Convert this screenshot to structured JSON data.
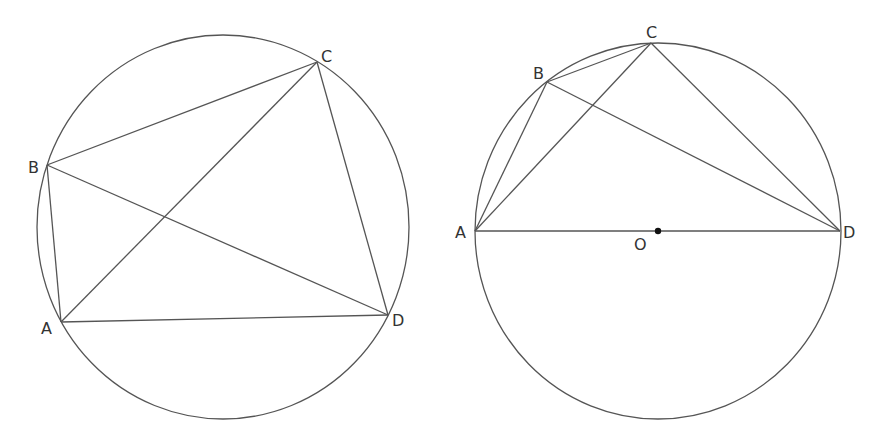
{
  "colors": {
    "stroke": "#555555",
    "label": "#333333",
    "background": "#ffffff",
    "center_dot": "#111111"
  },
  "figures": [
    {
      "id": "left",
      "circle": {
        "cx": 223,
        "cy": 227,
        "rx": 186,
        "ry": 192
      },
      "points": {
        "A": {
          "label": "A",
          "x": 61,
          "y": 322,
          "lx": 41,
          "ly": 334
        },
        "B": {
          "label": "B",
          "x": 47,
          "y": 165,
          "lx": 28,
          "ly": 173
        },
        "C": {
          "label": "C",
          "x": 317,
          "y": 62,
          "lx": 321,
          "ly": 62
        },
        "D": {
          "label": "D",
          "x": 388,
          "y": 315,
          "lx": 392,
          "ly": 326
        }
      },
      "segments": [
        [
          "A",
          "B"
        ],
        [
          "B",
          "C"
        ],
        [
          "C",
          "D"
        ],
        [
          "D",
          "A"
        ],
        [
          "A",
          "C"
        ],
        [
          "B",
          "D"
        ]
      ]
    },
    {
      "id": "right",
      "circle": {
        "cx": 658,
        "cy": 231,
        "rx": 183,
        "ry": 188
      },
      "points": {
        "A": {
          "label": "A",
          "x": 475,
          "y": 231,
          "lx": 455,
          "ly": 238
        },
        "B": {
          "label": "B",
          "x": 547,
          "y": 82,
          "lx": 533,
          "ly": 79
        },
        "C": {
          "label": "C",
          "x": 651,
          "y": 43,
          "lx": 646,
          "ly": 38
        },
        "D": {
          "label": "D",
          "x": 840,
          "y": 231,
          "lx": 843,
          "ly": 238
        },
        "O": {
          "label": "O",
          "x": 658,
          "y": 231,
          "lx": 634,
          "ly": 250
        }
      },
      "segments": [
        [
          "A",
          "B"
        ],
        [
          "B",
          "C"
        ],
        [
          "A",
          "C"
        ],
        [
          "C",
          "D"
        ],
        [
          "B",
          "D"
        ],
        [
          "A",
          "D"
        ]
      ],
      "center_point": "O"
    }
  ]
}
